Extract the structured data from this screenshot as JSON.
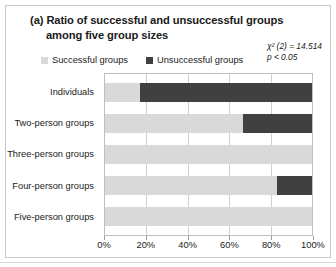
{
  "chart_data": {
    "type": "bar",
    "orientation": "horizontal",
    "stacked": true,
    "percent": true,
    "title": "(a) Ratio of successful and unsuccessful groups",
    "title_line2": "among five group sizes",
    "xlabel": "",
    "ylabel": "",
    "xlim": [
      0,
      100
    ],
    "grid": true,
    "legend_position": "top",
    "categories": [
      "Individuals",
      "Two-person groups",
      "Three-person groups",
      "Four-person groups",
      "Five-person groups"
    ],
    "series": [
      {
        "name": "Successful groups",
        "color": "#d9d9d9",
        "values": [
          16.7,
          66.7,
          100,
          83.3,
          100
        ]
      },
      {
        "name": "Unsuccessful groups",
        "color": "#404040",
        "values": [
          83.3,
          33.3,
          0,
          16.7,
          0
        ]
      }
    ],
    "xticks": [
      0,
      20,
      40,
      60,
      80,
      100
    ],
    "xtick_labels": [
      "0%",
      "20%",
      "40%",
      "60%",
      "80%",
      "100%"
    ],
    "annotations": {
      "chi_square": "χ² (2) = 14.514",
      "p_value": "p < 0.05"
    }
  },
  "legend": {
    "items": [
      {
        "label": "Successful groups",
        "color": "#d9d9d9"
      },
      {
        "label": "Unsuccessful groups",
        "color": "#404040"
      }
    ]
  }
}
